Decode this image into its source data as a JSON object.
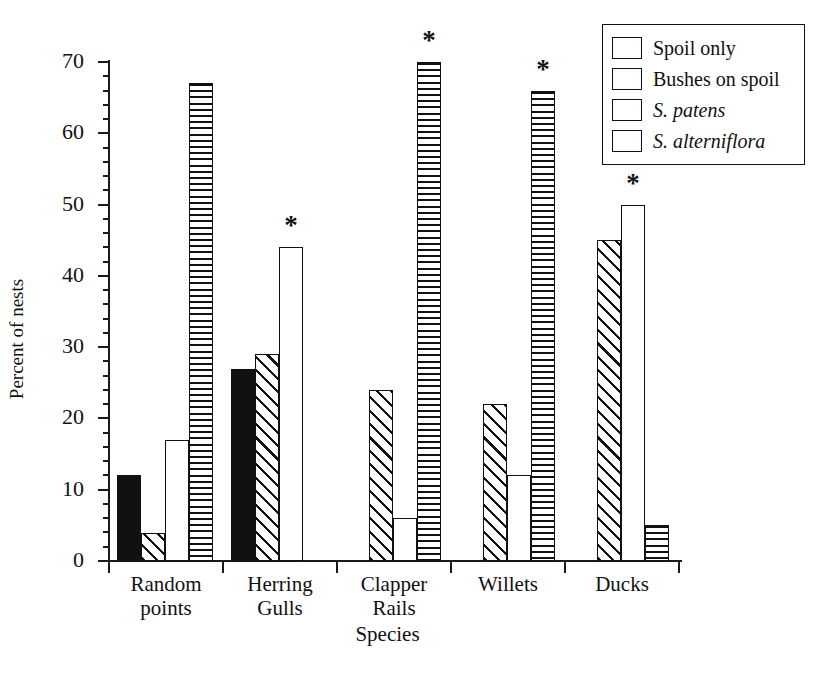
{
  "chart_data": {
    "type": "bar",
    "title": "",
    "xlabel": "Species",
    "ylabel": "Percent of nests",
    "ylim": [
      0,
      70
    ],
    "y_ticks": [
      0,
      10,
      20,
      30,
      40,
      50,
      60,
      70
    ],
    "y_minor_tick_step": 2,
    "grid": false,
    "legend_position": "top-right",
    "categories": [
      "Random points",
      "Herring Gulls",
      "Clapper Rails",
      "Willets",
      "Ducks"
    ],
    "category_lines": [
      [
        "Random",
        "points"
      ],
      [
        "Herring",
        "Gulls"
      ],
      [
        "Clapper",
        "Rails"
      ],
      [
        "Willets"
      ],
      [
        "Ducks"
      ]
    ],
    "series": [
      {
        "name": "Spoil only",
        "fill": "solid",
        "italic": false,
        "values": [
          12,
          27,
          null,
          null,
          null
        ]
      },
      {
        "name": "Bushes on spoil",
        "fill": "diagonal",
        "italic": false,
        "values": [
          4,
          29,
          24,
          22,
          45
        ]
      },
      {
        "name": "S. patens",
        "fill": "blank",
        "italic": true,
        "values": [
          17,
          44,
          6,
          12,
          50
        ]
      },
      {
        "name": "S. alterniflora",
        "fill": "horizontal",
        "italic": true,
        "values": [
          67,
          null,
          70,
          66,
          5
        ]
      }
    ],
    "annotations": [
      {
        "symbol": "*",
        "category": "Herring Gulls",
        "series": "S. patens",
        "value": 44
      },
      {
        "symbol": "*",
        "category": "Clapper Rails",
        "series": "S. alterniflora",
        "value": 70
      },
      {
        "symbol": "*",
        "category": "Willets",
        "series": "S. alterniflora",
        "value": 66
      },
      {
        "symbol": "*",
        "category": "Ducks",
        "series": "S. patens",
        "value": 50
      }
    ],
    "colors": {
      "ink": "#111111",
      "background": "#ffffff"
    }
  }
}
